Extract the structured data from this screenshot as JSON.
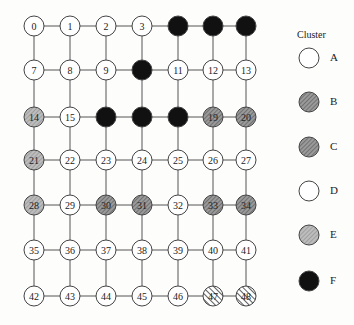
{
  "grid": {
    "cols_x": [
      34,
      70,
      106,
      142,
      178,
      213,
      246
    ],
    "rows_y": [
      26,
      70,
      117,
      160,
      205,
      250,
      296
    ],
    "node_radius": 10,
    "nodes": [
      {
        "id": 0,
        "cluster": "A"
      },
      {
        "id": 1,
        "cluster": "A"
      },
      {
        "id": 2,
        "cluster": "A"
      },
      {
        "id": 3,
        "cluster": "A"
      },
      {
        "id": 4,
        "cluster": "F"
      },
      {
        "id": 5,
        "cluster": "F"
      },
      {
        "id": 6,
        "cluster": "F"
      },
      {
        "id": 7,
        "cluster": "A"
      },
      {
        "id": 8,
        "cluster": "A"
      },
      {
        "id": 9,
        "cluster": "A"
      },
      {
        "id": 10,
        "cluster": "F"
      },
      {
        "id": 11,
        "cluster": "A"
      },
      {
        "id": 12,
        "cluster": "A"
      },
      {
        "id": 13,
        "cluster": "A"
      },
      {
        "id": 14,
        "cluster": "E"
      },
      {
        "id": 15,
        "cluster": "D"
      },
      {
        "id": 16,
        "cluster": "F"
      },
      {
        "id": 17,
        "cluster": "F"
      },
      {
        "id": 18,
        "cluster": "F"
      },
      {
        "id": 19,
        "cluster": "C"
      },
      {
        "id": 20,
        "cluster": "C"
      },
      {
        "id": 21,
        "cluster": "E"
      },
      {
        "id": 22,
        "cluster": "D"
      },
      {
        "id": 23,
        "cluster": "D"
      },
      {
        "id": 24,
        "cluster": "D"
      },
      {
        "id": 25,
        "cluster": "D"
      },
      {
        "id": 26,
        "cluster": "D"
      },
      {
        "id": 27,
        "cluster": "D"
      },
      {
        "id": 28,
        "cluster": "E"
      },
      {
        "id": 29,
        "cluster": "D"
      },
      {
        "id": 30,
        "cluster": "B"
      },
      {
        "id": 31,
        "cluster": "B"
      },
      {
        "id": 32,
        "cluster": "D"
      },
      {
        "id": 33,
        "cluster": "C"
      },
      {
        "id": 34,
        "cluster": "C"
      },
      {
        "id": 35,
        "cluster": "D"
      },
      {
        "id": 36,
        "cluster": "D"
      },
      {
        "id": 37,
        "cluster": "D"
      },
      {
        "id": 38,
        "cluster": "D"
      },
      {
        "id": 39,
        "cluster": "D"
      },
      {
        "id": 40,
        "cluster": "D"
      },
      {
        "id": 41,
        "cluster": "D"
      },
      {
        "id": 42,
        "cluster": "D"
      },
      {
        "id": 43,
        "cluster": "D"
      },
      {
        "id": 44,
        "cluster": "D"
      },
      {
        "id": 45,
        "cluster": "D"
      },
      {
        "id": 46,
        "cluster": "D"
      },
      {
        "id": 47,
        "cluster": "E"
      },
      {
        "id": 48,
        "cluster": "E"
      }
    ],
    "hidden_labels": [
      4,
      5,
      6,
      10,
      16,
      17,
      18
    ]
  },
  "legend": {
    "title": "Cluster",
    "items": [
      {
        "label": "A",
        "style": "white"
      },
      {
        "label": "B",
        "style": "hatch-dark"
      },
      {
        "label": "C",
        "style": "hatch-dark"
      },
      {
        "label": "D",
        "style": "white"
      },
      {
        "label": "E",
        "style": "hatch-light"
      },
      {
        "label": "F",
        "style": "black"
      }
    ]
  },
  "colors": {
    "white_fill": "#ffffff",
    "black_fill": "#111111",
    "hatch_dark_bg": "#9a9a9a",
    "hatch_light_bg": "#b8b8b8",
    "stroke": "#444444"
  }
}
